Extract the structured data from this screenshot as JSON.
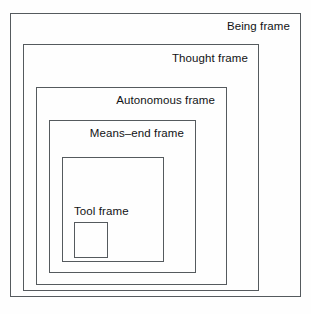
{
  "diagram": {
    "type": "nested-frames",
    "line_color": "#555a5e",
    "text_color": "#111315",
    "background_color": "#fefefe",
    "frames": [
      {
        "id": "being",
        "label": "Being frame",
        "level": 1,
        "label_align": "right"
      },
      {
        "id": "thought",
        "label": "Thought frame",
        "level": 2,
        "label_align": "right"
      },
      {
        "id": "autonomous",
        "label": "Autonomous frame",
        "level": 3,
        "label_align": "right"
      },
      {
        "id": "means_end",
        "label": "Means–end frame",
        "level": 4,
        "label_align": "right"
      },
      {
        "id": "tool",
        "label": "Tool frame",
        "level": 5,
        "label_align": "left"
      },
      {
        "id": "innermost",
        "label": "",
        "level": 6,
        "label_align": "none"
      }
    ]
  }
}
